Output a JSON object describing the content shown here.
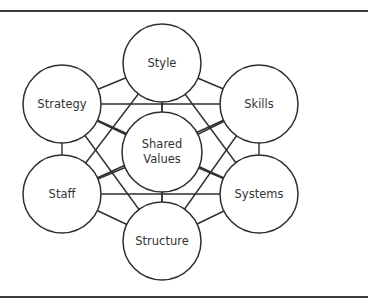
{
  "diagram": {
    "colors": {
      "stroke": "#2e2e2e",
      "text": "#333333",
      "background": "#ffffff"
    },
    "frame": {
      "top_rule_y": 11,
      "bottom_rule_y": 297
    },
    "nodes": [
      {
        "id": "style",
        "lines": [
          "Style"
        ],
        "cx": 162,
        "cy": 63,
        "r": 39
      },
      {
        "id": "strategy",
        "lines": [
          "Strategy"
        ],
        "cx": 62,
        "cy": 104,
        "r": 39
      },
      {
        "id": "skills",
        "lines": [
          "Skills"
        ],
        "cx": 259,
        "cy": 104,
        "r": 39
      },
      {
        "id": "shared-values",
        "lines": [
          "Shared",
          "Values"
        ],
        "cx": 162,
        "cy": 152,
        "r": 40
      },
      {
        "id": "staff",
        "lines": [
          "Staff"
        ],
        "cx": 62,
        "cy": 194,
        "r": 39
      },
      {
        "id": "systems",
        "lines": [
          "Systems"
        ],
        "cx": 259,
        "cy": 194,
        "r": 39
      },
      {
        "id": "structure",
        "lines": [
          "Structure"
        ],
        "cx": 162,
        "cy": 241,
        "r": 39
      }
    ],
    "edges": [
      [
        "style",
        "strategy"
      ],
      [
        "style",
        "skills"
      ],
      [
        "style",
        "shared-values"
      ],
      [
        "style",
        "staff"
      ],
      [
        "style",
        "systems"
      ],
      [
        "style",
        "structure"
      ],
      [
        "strategy",
        "skills"
      ],
      [
        "strategy",
        "shared-values"
      ],
      [
        "strategy",
        "staff"
      ],
      [
        "strategy",
        "systems"
      ],
      [
        "strategy",
        "structure"
      ],
      [
        "skills",
        "shared-values"
      ],
      [
        "skills",
        "staff"
      ],
      [
        "skills",
        "systems"
      ],
      [
        "skills",
        "structure"
      ],
      [
        "shared-values",
        "staff"
      ],
      [
        "shared-values",
        "systems"
      ],
      [
        "shared-values",
        "structure"
      ],
      [
        "staff",
        "systems"
      ],
      [
        "staff",
        "structure"
      ],
      [
        "systems",
        "structure"
      ]
    ]
  }
}
